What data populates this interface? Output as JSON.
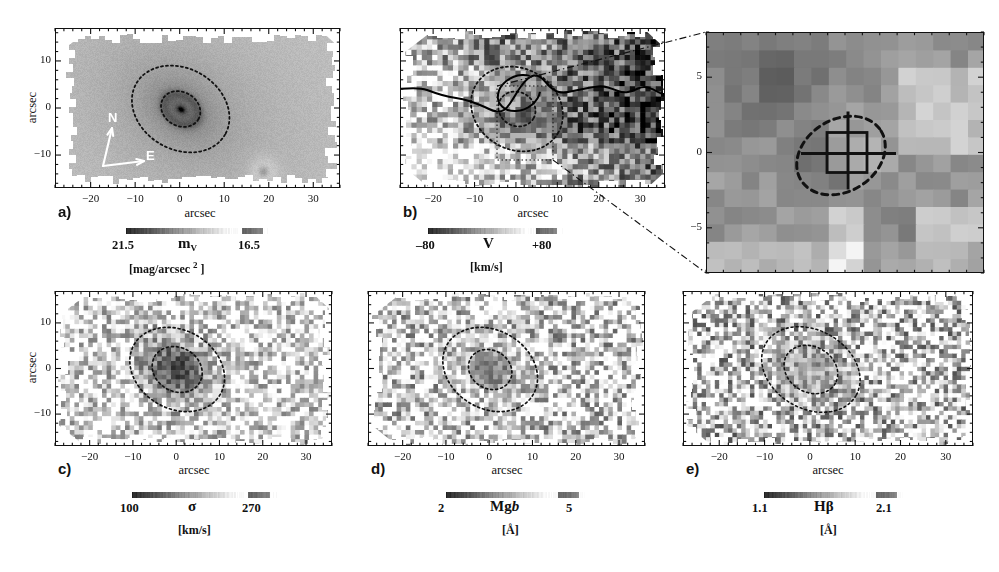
{
  "figure": {
    "type": "astronomical-imaging-figure",
    "axis_label_x": "arcsec",
    "axis_label_y": "arcsec",
    "panel_count": 6
  },
  "chart_data": {
    "type": "heatmap",
    "title": "",
    "xlabel": "arcsec",
    "ylabel": "arcsec",
    "grid": false,
    "legend_position": "below-each-panel",
    "panels": [
      {
        "id": "a",
        "label": "a)",
        "quantity": "m_V",
        "quantity_display": "m",
        "quantity_sub": "V",
        "unit": "[mag/arcsec 2 ]",
        "cbar_low": "21.5",
        "cbar_high": "16.5",
        "xlim": [
          -28,
          36
        ],
        "ylim": [
          -17,
          17
        ],
        "xticks": [
          -20,
          -10,
          0,
          10,
          20,
          30
        ],
        "yticks": [
          10,
          0,
          -10
        ],
        "xtick_labels": [
          "-20",
          "-10",
          "0",
          "10",
          "20",
          "30"
        ],
        "ytick_labels": [
          "10",
          "0",
          "-10"
        ],
        "compass": {
          "north": "N",
          "east": "E"
        },
        "ellipses": [
          {
            "cx": 0,
            "cy": 0,
            "rx": 11.5,
            "ry": 8.6,
            "angle": -30,
            "style": "dotted"
          },
          {
            "cx": 0,
            "cy": 0,
            "rx": 4.6,
            "ry": 3.6,
            "angle": -30,
            "style": "dotted"
          }
        ]
      },
      {
        "id": "b",
        "label": "b)",
        "quantity": "V",
        "quantity_display": "V",
        "unit": "[km/s]",
        "cbar_low": "–80",
        "cbar_high": "+80",
        "xlim": [
          -28,
          36
        ],
        "ylim": [
          -17,
          17
        ],
        "xticks": [
          -20,
          -10,
          0,
          10,
          20,
          30
        ],
        "yticks": [
          10,
          0,
          -10
        ],
        "xtick_labels": [
          "-20",
          "-10",
          "0",
          "10",
          "20",
          "30"
        ],
        "ytick_labels": [
          "10",
          "0",
          "-10"
        ],
        "zero_velocity_contour": true,
        "ellipses": [
          {
            "cx": 0,
            "cy": 0,
            "rx": 11.5,
            "ry": 8.6,
            "angle": -30,
            "style": "dotted"
          },
          {
            "cx": 0,
            "cy": 0,
            "rx": 4.6,
            "ry": 3.6,
            "angle": -30,
            "style": "dotted"
          }
        ]
      },
      {
        "id": "inset",
        "label": "",
        "quantity": "V",
        "unit": "",
        "xlim": [
          -8,
          8
        ],
        "ylim": [
          -8,
          8
        ],
        "yticks": [
          5,
          0,
          -5
        ],
        "ytick_labels": [
          "5",
          "0",
          "-5"
        ],
        "marker_box": true,
        "marker_cross": true,
        "ellipses": [
          {
            "cx": 0,
            "cy": 0,
            "rx": 2.6,
            "ry": 2.0,
            "angle": -30,
            "style": "dashed"
          }
        ]
      },
      {
        "id": "c",
        "label": "c)",
        "quantity": "sigma",
        "quantity_display": "σ",
        "unit": "[km/s]",
        "cbar_low": "100",
        "cbar_high": "270",
        "xlim": [
          -28,
          36
        ],
        "ylim": [
          -17,
          17
        ],
        "xticks": [
          -20,
          -10,
          0,
          10,
          20,
          30
        ],
        "yticks": [
          10,
          0,
          -10
        ],
        "xtick_labels": [
          "-20",
          "-10",
          "0",
          "10",
          "20",
          "30"
        ],
        "ytick_labels": [
          "10",
          "0",
          "-10"
        ],
        "ellipses": [
          {
            "cx": 0,
            "cy": 0,
            "rx": 11.5,
            "ry": 8.6,
            "angle": -30,
            "style": "dotted"
          },
          {
            "cx": 0,
            "cy": 0,
            "rx": 6.0,
            "ry": 4.8,
            "angle": -30,
            "style": "dotted"
          }
        ]
      },
      {
        "id": "d",
        "label": "d)",
        "quantity": "Mg b",
        "quantity_display": "Mg",
        "quantity_italic": "b",
        "unit": "[Å]",
        "cbar_low": "2",
        "cbar_high": "5",
        "xlim": [
          -28,
          36
        ],
        "ylim": [
          -17,
          17
        ],
        "xticks": [
          -20,
          -10,
          0,
          10,
          20,
          30
        ],
        "yticks": [
          10,
          0,
          -10
        ],
        "xtick_labels": [
          "-20",
          "-10",
          "0",
          "10",
          "20",
          "30"
        ],
        "ytick_labels": [
          "10",
          "0",
          "-10"
        ],
        "ellipses": [
          {
            "cx": 0,
            "cy": 0,
            "rx": 11.5,
            "ry": 8.6,
            "angle": -30,
            "style": "dotted"
          },
          {
            "cx": 0,
            "cy": 0,
            "rx": 5.2,
            "ry": 4.2,
            "angle": -30,
            "style": "dotted"
          }
        ]
      },
      {
        "id": "e",
        "label": "e)",
        "quantity": "Hbeta",
        "quantity_display": "Hβ",
        "unit": "[Å]",
        "cbar_low": "1.1",
        "cbar_high": "2.1",
        "xlim": [
          -28,
          36
        ],
        "ylim": [
          -17,
          17
        ],
        "xticks": [
          -20,
          -10,
          0,
          10,
          20,
          30
        ],
        "yticks": [
          10,
          0,
          -10
        ],
        "xtick_labels": [
          "-20",
          "-10",
          "0",
          "10",
          "20",
          "30"
        ],
        "ytick_labels": [
          "10",
          "0",
          "-10"
        ],
        "ellipses": [
          {
            "cx": 0,
            "cy": 0,
            "rx": 11.5,
            "ry": 8.6,
            "angle": -30,
            "style": "dotted"
          },
          {
            "cx": 0,
            "cy": 0,
            "rx": 6.2,
            "ry": 5.0,
            "angle": -30,
            "style": "dotted"
          }
        ]
      }
    ]
  }
}
